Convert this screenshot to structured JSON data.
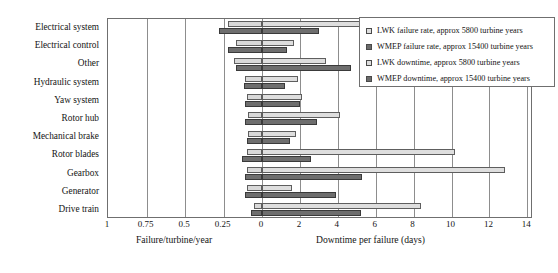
{
  "chart_data": {
    "type": "bar",
    "title": "",
    "subtitle": "",
    "orientation": "horizontal-diverging",
    "grid": true,
    "legend_position": "top-right",
    "categories": [
      "Electrical system",
      "Electrical control",
      "Other",
      "Hydraulic system",
      "Yaw system",
      "Rotor hub",
      "Mechanical brake",
      "Rotor blades",
      "Gearbox",
      "Generator",
      "Drive train"
    ],
    "left_axis": {
      "label": "Failure/turbine/year",
      "ticks": [
        1,
        0.75,
        0.5,
        0.25,
        0
      ],
      "tick_labels": [
        "1",
        "0.75",
        "0.5",
        "0.25",
        "0"
      ],
      "range": [
        1,
        0
      ],
      "direction": "right-to-left"
    },
    "right_axis": {
      "label": "Downtime per failure (days)",
      "ticks": [
        0,
        2,
        4,
        6,
        8,
        10,
        12,
        14
      ],
      "tick_labels": [
        "0",
        "2",
        "4",
        "6",
        "8",
        "10",
        "12",
        "14"
      ],
      "range": [
        0,
        14
      ],
      "direction": "left-to-right"
    },
    "series": [
      {
        "name": "LWK failure rate, approx 5800 turbine years",
        "key": "lwk_failure",
        "axis": "left",
        "units": "failures/turbine/year",
        "color": "#dedede",
        "values": [
          0.22,
          0.17,
          0.18,
          0.11,
          0.1,
          0.09,
          0.09,
          0.1,
          0.1,
          0.1,
          0.05
        ]
      },
      {
        "name": "WMEP failure rate, approx 15400 turbine years",
        "key": "wmep_failure",
        "axis": "left",
        "units": "failures/turbine/year",
        "color": "#6e6e6e",
        "values": [
          0.28,
          0.22,
          0.17,
          0.12,
          0.11,
          0.11,
          0.1,
          0.13,
          0.11,
          0.11,
          0.07
        ]
      },
      {
        "name": "LWK downtime, approx 5800 turbine years",
        "key": "lwk_downtime",
        "axis": "right",
        "units": "days",
        "color": "#dedede",
        "values": [
          5.9,
          1.7,
          3.4,
          1.9,
          2.1,
          4.1,
          1.8,
          10.2,
          12.8,
          1.6,
          8.4
        ]
      },
      {
        "name": "WMEP downtime, approx 15400 turbine years",
        "key": "wmep_downtime",
        "axis": "right",
        "units": "days",
        "color": "#6e6e6e",
        "values": [
          3.0,
          1.3,
          4.7,
          1.2,
          2.0,
          2.9,
          1.5,
          2.6,
          5.3,
          3.9,
          5.2
        ]
      }
    ]
  },
  "legend": {
    "items": [
      {
        "label": "LWK failure rate, approx 5800 turbine years",
        "swatch": "light"
      },
      {
        "label": "WMEP failure rate, approx 15400 turbine years",
        "swatch": "dark"
      },
      {
        "label": "LWK downtime, approx 5800 turbine years",
        "swatch": "light"
      },
      {
        "label": "WMEP downtime, approx 15400 turbine years",
        "swatch": "dark"
      }
    ]
  }
}
